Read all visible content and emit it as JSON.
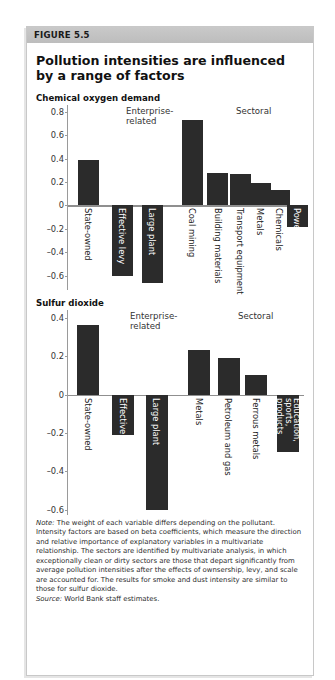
{
  "figure": {
    "label": "FIGURE 5.5",
    "title": "Pollution intensities are influenced by a range of factors",
    "note_prefix": "Note:",
    "note_text": " The weight of each variable differs depending on the pollutant. Intensity factors are based on beta coefficients, which measure the direction and relative importance of explanatory variables in a multivariate relationship. The sectors are identified by multivariate analysis, in which exceptionally clean or dirty sectors are those that depart significantly from average pollution intensities after the effects of ownsership, levy, and scale are accounted for. The results for smoke and dust intensity are similar to those for sulfur dioxide.",
    "source_prefix": "Source:",
    "source_text": " World Bank staff estimates.",
    "bar_color": "#2b2b2b",
    "axis_color": "#8f8f8f",
    "header_color": "#c3c3c3"
  },
  "chart_data": [
    {
      "type": "bar",
      "title": "Chemical oxygen demand",
      "xlabel": "",
      "ylabel": "",
      "ylim": [
        -0.6,
        0.8
      ],
      "yticks": [
        0.8,
        0.6,
        0.4,
        0.2,
        0,
        -0.2,
        -0.4,
        -0.6
      ],
      "ytick_labels": [
        "0.8",
        "0.6",
        "0.4",
        "0.2",
        "0",
        "-0.2",
        "-0.4",
        "-0.6"
      ],
      "grid": false,
      "legend": "none",
      "group_labels": [
        {
          "text": "Enterprise-\nrelated",
          "group": "enterprise-related"
        },
        {
          "text": "Sectoral",
          "group": "sectoral"
        }
      ],
      "categories": [
        "State-owned",
        "Effective levy",
        "Large plant",
        "Coal mining",
        "Building materials",
        "Transport equipment",
        "Metals",
        "Chemicals",
        "Power"
      ],
      "values": [
        0.39,
        -0.6,
        -0.66,
        0.73,
        0.28,
        0.27,
        0.19,
        0.13,
        -0.18
      ],
      "groups": [
        "Enterprise-related",
        "Enterprise-related",
        "Enterprise-related",
        "Sectoral",
        "Sectoral",
        "Sectoral",
        "Sectoral",
        "Sectoral",
        "Sectoral"
      ]
    },
    {
      "type": "bar",
      "title": "Sulfur dioxide",
      "xlabel": "",
      "ylabel": "",
      "ylim": [
        -0.6,
        0.4
      ],
      "yticks": [
        0.4,
        0.2,
        0,
        -0.2,
        -0.4,
        -0.6
      ],
      "ytick_labels": [
        "0.4",
        "0.2",
        "0",
        "-0.2",
        "-0.4",
        "-0.6"
      ],
      "grid": false,
      "legend": "none",
      "group_labels": [
        {
          "text": "Enterprise-\nrelated",
          "group": "enterprise-related"
        },
        {
          "text": "Sectoral",
          "group": "sectoral"
        }
      ],
      "categories": [
        "State-owned",
        "Effective levy",
        "Large plant",
        "Metals",
        "Petroleum and gas",
        "Ferrous metals",
        "Education, sports, products"
      ],
      "values": [
        0.36,
        -0.21,
        -0.6,
        0.23,
        0.19,
        0.1,
        -0.3
      ],
      "groups": [
        "Enterprise-related",
        "Enterprise-related",
        "Enterprise-related",
        "Sectoral",
        "Sectoral",
        "Sectoral",
        "Sectoral"
      ]
    }
  ]
}
